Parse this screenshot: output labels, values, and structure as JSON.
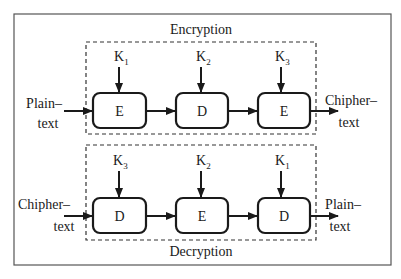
{
  "diagram": {
    "type": "block-diagram",
    "encryption": {
      "label": "Encryption",
      "input": {
        "line1": "Plain–",
        "line2": "text"
      },
      "output": {
        "line1": "Chipher–",
        "line2": "text"
      },
      "stages": [
        {
          "op": "E",
          "key": "K",
          "key_sub": "1"
        },
        {
          "op": "D",
          "key": "K",
          "key_sub": "2"
        },
        {
          "op": "E",
          "key": "K",
          "key_sub": "3"
        }
      ]
    },
    "decryption": {
      "label": "Decryption",
      "input": {
        "line1": "Chipher–",
        "line2": "text"
      },
      "output": {
        "line1": "Plain–",
        "line2": "text"
      },
      "stages": [
        {
          "op": "D",
          "key": "K",
          "key_sub": "3"
        },
        {
          "op": "E",
          "key": "K",
          "key_sub": "2"
        },
        {
          "op": "D",
          "key": "K",
          "key_sub": "1"
        }
      ]
    },
    "colors": {
      "stroke": "#1a1a1a",
      "border": "#555555",
      "background": "#ffffff"
    }
  }
}
